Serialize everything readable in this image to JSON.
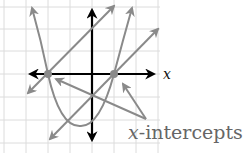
{
  "diagram": {
    "title": "",
    "axis_label_x": "x",
    "annotation_label_italic": "x",
    "annotation_label_rest": "-intercepts",
    "colors": {
      "grid": "#dcdcdc",
      "axes": "#000000",
      "curves": "#8a8a8a",
      "intercept_points": "#8a8a8a",
      "label": "#666666"
    },
    "grid": {
      "x_lines": [
        4,
        26,
        48,
        70,
        92,
        114,
        136,
        158
      ],
      "y_lines": [
        7,
        29,
        51,
        74,
        97,
        120,
        143
      ]
    },
    "origin_px": [
      92,
      74
    ],
    "intercepts_px": [
      [
        48,
        74
      ],
      [
        114,
        74
      ]
    ],
    "elements": [
      {
        "type": "parabola",
        "through": "both x-intercepts",
        "opens": "up"
      },
      {
        "type": "line",
        "through": "left x-intercept",
        "slope": "positive"
      },
      {
        "type": "line",
        "through": "right x-intercept",
        "slope": "positive"
      }
    ],
    "annotation": "x-intercepts"
  }
}
